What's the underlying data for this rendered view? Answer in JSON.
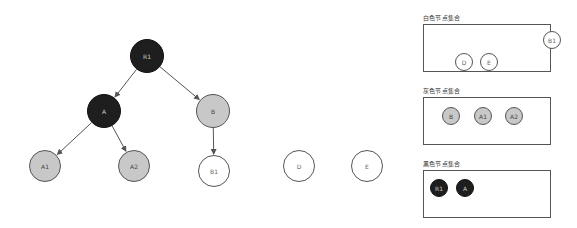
{
  "graph": {
    "nodes": [
      {
        "id": "R1",
        "label": "R1",
        "color": "black",
        "x": 147,
        "y": 56,
        "r": 17
      },
      {
        "id": "A",
        "label": "A",
        "color": "black",
        "x": 104,
        "y": 111,
        "r": 17
      },
      {
        "id": "B",
        "label": "B",
        "color": "gray",
        "x": 213,
        "y": 111,
        "r": 17
      },
      {
        "id": "A1",
        "label": "A1",
        "color": "gray",
        "x": 45,
        "y": 166,
        "r": 16
      },
      {
        "id": "A2",
        "label": "A2",
        "color": "gray",
        "x": 134,
        "y": 166,
        "r": 16
      },
      {
        "id": "B1",
        "label": "B1",
        "color": "white",
        "x": 214,
        "y": 171,
        "r": 16
      },
      {
        "id": "D",
        "label": "D",
        "color": "white",
        "x": 299,
        "y": 166,
        "r": 16
      },
      {
        "id": "E",
        "label": "E",
        "color": "white",
        "x": 367,
        "y": 166,
        "r": 16
      }
    ],
    "edges": [
      {
        "from": "R1",
        "to": "A"
      },
      {
        "from": "R1",
        "to": "B"
      },
      {
        "from": "A",
        "to": "A1"
      },
      {
        "from": "A",
        "to": "A2"
      },
      {
        "from": "B",
        "to": "B1"
      }
    ]
  },
  "sets": {
    "white": {
      "title": "白色节点集合",
      "nodes": [
        {
          "label": "B1",
          "x": 128,
          "y": 15
        },
        {
          "label": "D",
          "x": 40,
          "y": 37
        },
        {
          "label": "E",
          "x": 65,
          "y": 37
        }
      ]
    },
    "gray": {
      "title": "灰色节点集合",
      "nodes": [
        {
          "label": "B",
          "x": 27,
          "y": 18
        },
        {
          "label": "A1",
          "x": 59,
          "y": 18
        },
        {
          "label": "A2",
          "x": 90,
          "y": 18
        }
      ]
    },
    "black": {
      "title": "黑色节点集合",
      "nodes": [
        {
          "label": "R1",
          "x": 15,
          "y": 17
        },
        {
          "label": "A",
          "x": 41,
          "y": 17
        }
      ]
    }
  },
  "colors": {
    "black": "#1e1e1e",
    "gray": "#c8c8c8",
    "white": "#ffffff",
    "stroke": "#555555"
  }
}
